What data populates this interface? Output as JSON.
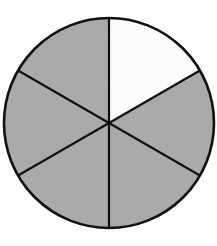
{
  "diagram": {
    "type": "fraction-circle",
    "center": {
      "x": 109,
      "y": 123
    },
    "radius": 105,
    "total_parts": 6,
    "shaded_parts": 5,
    "unshaded_parts": 1,
    "fraction_shaded": "5/6",
    "start_angle_deg": 90,
    "sectors": [
      {
        "index": 0,
        "from_deg": 90,
        "to_deg": 30,
        "shaded": false
      },
      {
        "index": 1,
        "from_deg": 30,
        "to_deg": -30,
        "shaded": true
      },
      {
        "index": 2,
        "from_deg": -30,
        "to_deg": -90,
        "shaded": true
      },
      {
        "index": 3,
        "from_deg": -90,
        "to_deg": -150,
        "shaded": true
      },
      {
        "index": 4,
        "from_deg": -150,
        "to_deg": -210,
        "shaded": true
      },
      {
        "index": 5,
        "from_deg": 150,
        "to_deg": 90,
        "shaded": true
      }
    ],
    "colors": {
      "shaded": "#a9a9a9",
      "unshaded": "#ffffff",
      "stroke": "#111111"
    },
    "stroke_width": 2.2
  }
}
